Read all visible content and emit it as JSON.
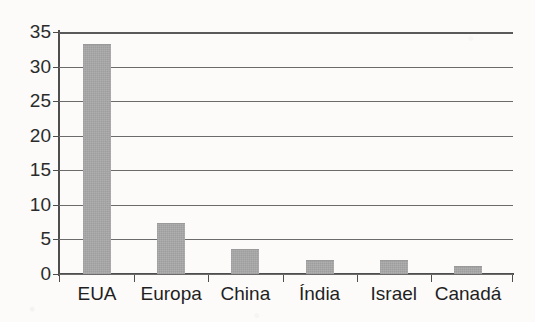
{
  "chart_data": {
    "type": "bar",
    "title": "",
    "subtitle": "",
    "xlabel": "",
    "ylabel": "",
    "categories": [
      "EUA",
      "Europa",
      "China",
      "Índia",
      "Israel",
      "Canadá"
    ],
    "values": [
      33.2,
      7.4,
      3.6,
      2.0,
      2.0,
      1.1
    ],
    "series": [
      {
        "name": "",
        "values": [
          33.2,
          7.4,
          3.6,
          2.0,
          2.0,
          1.1
        ]
      }
    ],
    "ylim": [
      0,
      35
    ],
    "yticks": [
      0,
      5,
      10,
      15,
      20,
      25,
      30,
      35
    ],
    "ytick_labels": [
      "0",
      "5",
      "10",
      "15",
      "20",
      "25",
      "30",
      "35"
    ],
    "grid": true,
    "grid_axis": "y",
    "legend": false,
    "legend_position": "none",
    "bar_color": "#a9a9a9",
    "axis_color": "#4e4e4e",
    "grid_color": "#6b6b6b",
    "background_color": "#fcfbfa",
    "text_color": "#1f1f1f"
  }
}
